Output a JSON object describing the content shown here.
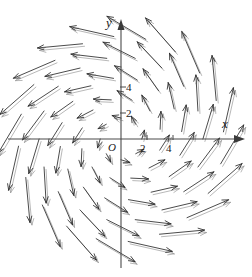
{
  "figure": {
    "background_color": "#ffffff",
    "width": 252,
    "height": 277
  },
  "axes": {
    "x_label": "x",
    "y_label": "y",
    "origin_label": "O",
    "origin_px": {
      "x": 121,
      "y": 139
    },
    "unit_px": 13.0,
    "x_ticks": [
      {
        "value": 2,
        "label": "2"
      },
      {
        "value": 4,
        "label": "4"
      }
    ],
    "y_ticks": [
      {
        "value": 2,
        "label": "2"
      },
      {
        "value": 4,
        "label": "4"
      }
    ],
    "axis_color": "#4a4a4a",
    "label_color": "#202020"
  },
  "chart_data": {
    "type": "scatter",
    "plot_kind": "vector-field",
    "xlabel": "x",
    "ylabel": "y",
    "xlim": [
      -9,
      9
    ],
    "ylim": [
      -9,
      9
    ],
    "grid": false,
    "legend": null,
    "vector_color": "#2b2b2b",
    "field_formula": {
      "u": "-y + 0.30*x",
      "v": "x + 0.30*y"
    },
    "sampling": {
      "radii": [
        1.6,
        3.1,
        4.7,
        6.3,
        7.9
      ],
      "counts_per_ring": [
        8,
        12,
        16,
        18,
        20
      ],
      "angle_offsets_deg": [
        0,
        14,
        7,
        20,
        4
      ]
    },
    "scale_px_per_unit": 13.0,
    "arrow_length_scale": 0.42,
    "arrow_head_length_px": 6.5,
    "arrow_head_angle_deg": 22,
    "faint_ghost_offset_px": {
      "x": 2.0,
      "y": 2.5
    },
    "categories": [],
    "values": []
  }
}
